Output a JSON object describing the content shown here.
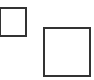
{
  "diagram": {
    "shapes": [
      {
        "id": "small-square",
        "type": "square",
        "x": -1,
        "y": 7,
        "width": 28,
        "height": 30,
        "stroke": "#333333",
        "fill": "#ffffff"
      },
      {
        "id": "large-square",
        "type": "square",
        "x": 43,
        "y": 27,
        "width": 48,
        "height": 50,
        "stroke": "#333333",
        "fill": "#ffffff"
      }
    ]
  }
}
